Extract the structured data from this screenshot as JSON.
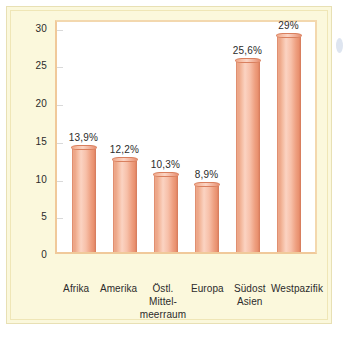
{
  "chart_data": {
    "type": "bar",
    "title": "",
    "subtitle": "",
    "xlabel": "",
    "ylabel": "",
    "categories": [
      "Afrika",
      "Amerika",
      "Östl. Mittel-\nmeerraum",
      "Europa",
      "Südost\nAsien",
      "Westpazifik"
    ],
    "values": [
      13.9,
      12.2,
      10.3,
      8.9,
      25.6,
      29
    ],
    "data_labels": [
      "13,9%",
      "12,2%",
      "10,3%",
      "8,9%",
      "25,6%",
      "29%"
    ],
    "ylim": [
      0,
      31
    ],
    "y_ticks": [
      0,
      5,
      10,
      15,
      20,
      25,
      30
    ],
    "y_tick_labels": [
      "0",
      "5",
      "10",
      "15",
      "20",
      "25",
      "30"
    ],
    "grid": true,
    "legend": null,
    "units": "percent",
    "series": [
      {
        "name": "Anteil",
        "values": [
          13.9,
          12.2,
          10.3,
          8.9,
          25.6,
          29
        ]
      }
    ]
  },
  "style": {
    "card_background": "#fbf8dc",
    "card_border": "#e8e0b4",
    "plot_background": "#ffffff",
    "plot_border": "#f0c99a",
    "bar_color": "#f2ab8c",
    "bar_shadow_color": "#de8163",
    "text_color": "#2b2b2b",
    "gridline_color": "#d9d9d9",
    "edge_artifact_color": "#c3cfe4"
  }
}
